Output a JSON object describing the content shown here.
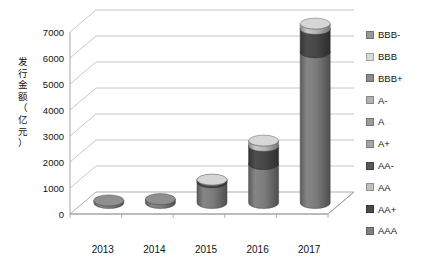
{
  "chart_data": {
    "type": "bar",
    "title": "",
    "subtitle": "",
    "xlabel": "",
    "ylabel": "发行金额（亿元）",
    "ylabel_chars": [
      "发",
      "行",
      "金",
      "额",
      "（",
      "亿",
      "元",
      "）"
    ],
    "categories": [
      "2013",
      "2014",
      "2015",
      "2016",
      "2017"
    ],
    "ytick_labels": [
      "0",
      "1000",
      "2000",
      "3000",
      "4000",
      "5000",
      "6000",
      "7000"
    ],
    "ytick_values": [
      0,
      1000,
      2000,
      3000,
      4000,
      5000,
      6000,
      7000
    ],
    "ylim": [
      0,
      7000
    ],
    "grid": true,
    "grid_axis": "y",
    "legend_position": "right",
    "style": "3d-stacked-cylinder",
    "series": [
      {
        "name": "AAA",
        "color": "#808080",
        "values": [
          100,
          150,
          800,
          1500,
          5800
        ]
      },
      {
        "name": "AA+",
        "color": "#4a4a4a",
        "values": [
          0,
          0,
          80,
          700,
          900
        ]
      },
      {
        "name": "AA",
        "color": "#bfbfbf",
        "values": [
          0,
          0,
          20,
          200,
          200
        ]
      },
      {
        "name": "AA-",
        "color": "#595959",
        "values": [
          0,
          0,
          0,
          0,
          0
        ]
      },
      {
        "name": "A+",
        "color": "#a6a6a6",
        "values": [
          0,
          0,
          0,
          0,
          0
        ]
      },
      {
        "name": "A",
        "color": "#9c9c9c",
        "values": [
          0,
          0,
          0,
          0,
          0
        ]
      },
      {
        "name": "A-",
        "color": "#b3b3b3",
        "values": [
          0,
          0,
          0,
          0,
          0
        ]
      },
      {
        "name": "BBB+",
        "color": "#8c8c8c",
        "values": [
          0,
          0,
          0,
          0,
          0
        ]
      },
      {
        "name": "BBB",
        "color": "#d9d9d9",
        "values": [
          0,
          0,
          0,
          0,
          0
        ]
      },
      {
        "name": "BBB-",
        "color": "#999999",
        "values": [
          0,
          0,
          0,
          0,
          0
        ]
      }
    ],
    "totals": [
      100,
      150,
      900,
      2400,
      6900
    ]
  },
  "legend": {
    "items": [
      {
        "label": "BBB-",
        "color": "#999999"
      },
      {
        "label": "BBB",
        "color": "#d9d9d9"
      },
      {
        "label": "BBB+",
        "color": "#8c8c8c"
      },
      {
        "label": "A-",
        "color": "#b3b3b3"
      },
      {
        "label": "A",
        "color": "#9c9c9c"
      },
      {
        "label": "A+",
        "color": "#a6a6a6"
      },
      {
        "label": "AA-",
        "color": "#595959"
      },
      {
        "label": "AA",
        "color": "#bfbfbf"
      },
      {
        "label": "AA+",
        "color": "#4a4a4a"
      },
      {
        "label": "AAA",
        "color": "#808080"
      }
    ]
  },
  "colors": {
    "gridline": "#b7b7b7",
    "axis": "#9a9a9a",
    "floor": "#ffffff",
    "text": "#111111"
  }
}
